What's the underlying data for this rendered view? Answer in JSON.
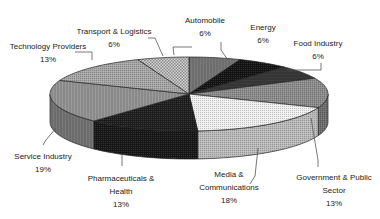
{
  "chart_data": {
    "type": "pie",
    "style": "3d-exploded-none-grayscale",
    "title": "",
    "start_angle_deg": 0,
    "direction": "clockwise",
    "slices": [
      {
        "label": "Automobile",
        "value": 6,
        "pct_label": "6%",
        "fill": "#7a7a7a",
        "pattern": "vlines"
      },
      {
        "label": "Energy",
        "value": 6,
        "pct_label": "6%",
        "fill": "#141414",
        "pattern": "dots"
      },
      {
        "label": "Food Industry",
        "value": 6,
        "pct_label": "6%",
        "fill": "#3c3c3c",
        "pattern": "hlines"
      },
      {
        "label": "Government & Public Sector",
        "value": 13,
        "pct_label": "13%",
        "fill": "#8c8c8c",
        "pattern": "dots"
      },
      {
        "label": "Media & Communications",
        "value": 18,
        "pct_label": "18%",
        "fill": "#efefef",
        "pattern": "dots"
      },
      {
        "label": "Pharmaceuticals & Health",
        "value": 13,
        "pct_label": "13%",
        "fill": "#1e1e1e",
        "pattern": "dots"
      },
      {
        "label": "Service Industry",
        "value": 19,
        "pct_label": "19%",
        "fill": "#9a9a9a",
        "pattern": "vlines"
      },
      {
        "label": "Technology Providers",
        "value": 13,
        "pct_label": "13%",
        "fill": "#a6a6a6",
        "pattern": "dots"
      },
      {
        "label": "Transport & Logistics",
        "value": 6,
        "pct_label": "6%",
        "fill": "#d6d6d6",
        "pattern": "checker"
      }
    ],
    "legend": "none",
    "data_labels": "category name and percentage with leader lines"
  },
  "labels": [
    {
      "lines": [
        "Automobile",
        "6%"
      ],
      "x": 205,
      "y": 14
    },
    {
      "lines": [
        "Energy",
        "6%"
      ],
      "x": 263,
      "y": 21
    },
    {
      "lines": [
        "Food Industry",
        "6%"
      ],
      "x": 318,
      "y": 37
    },
    {
      "lines": [
        "Government & Public",
        "Sector",
        "13%"
      ],
      "x": 334,
      "y": 171
    },
    {
      "lines": [
        "Media &",
        "Communications",
        "18%"
      ],
      "x": 229,
      "y": 168
    },
    {
      "lines": [
        "Pharmaceuticals &",
        "Health",
        "13%"
      ],
      "x": 121,
      "y": 172
    },
    {
      "lines": [
        "Service Industry",
        "19%"
      ],
      "x": 43,
      "y": 150
    },
    {
      "lines": [
        "Technology Providers",
        "13%"
      ],
      "x": 48,
      "y": 40
    },
    {
      "lines": [
        "Transport & Logistics",
        "6%"
      ],
      "x": 114,
      "y": 25
    }
  ]
}
